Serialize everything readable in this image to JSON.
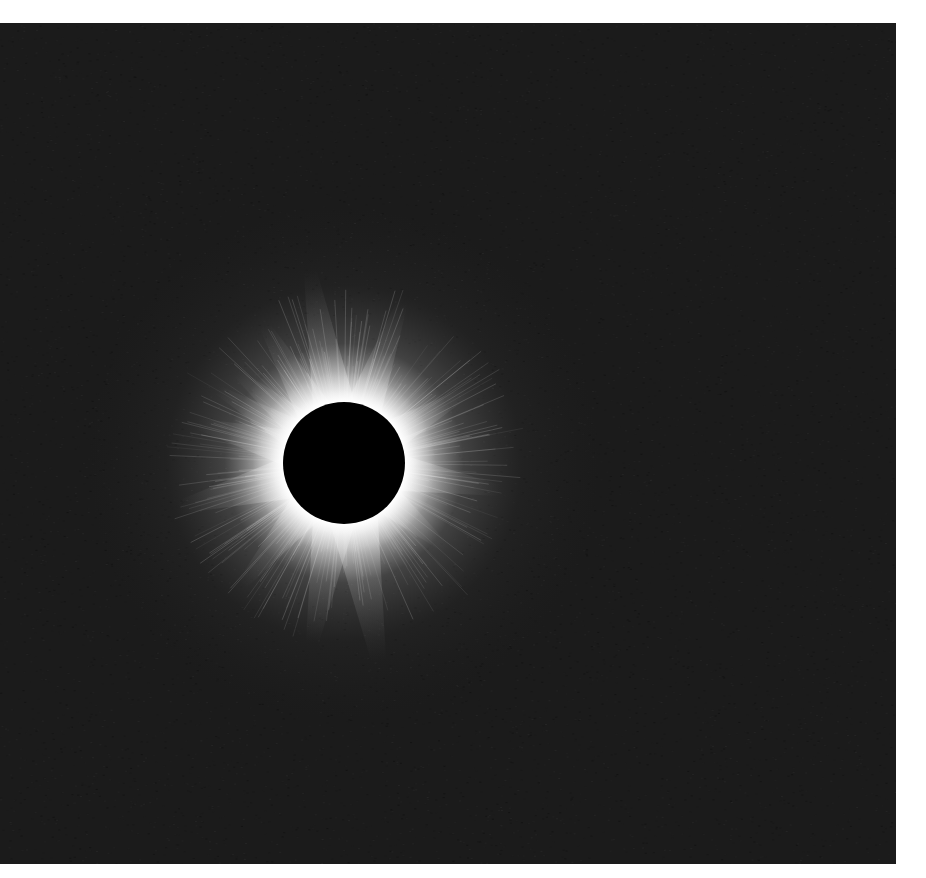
{
  "image": {
    "subject": "Total solar eclipse with corona",
    "background_color": "#1b1b1b",
    "corona_color": "#ffffff",
    "moon_color": "#000000",
    "frame": {
      "x": 0,
      "y": 23,
      "width": 896,
      "height": 841
    },
    "moon": {
      "cx": 344,
      "cy": 440,
      "r": 61
    }
  }
}
